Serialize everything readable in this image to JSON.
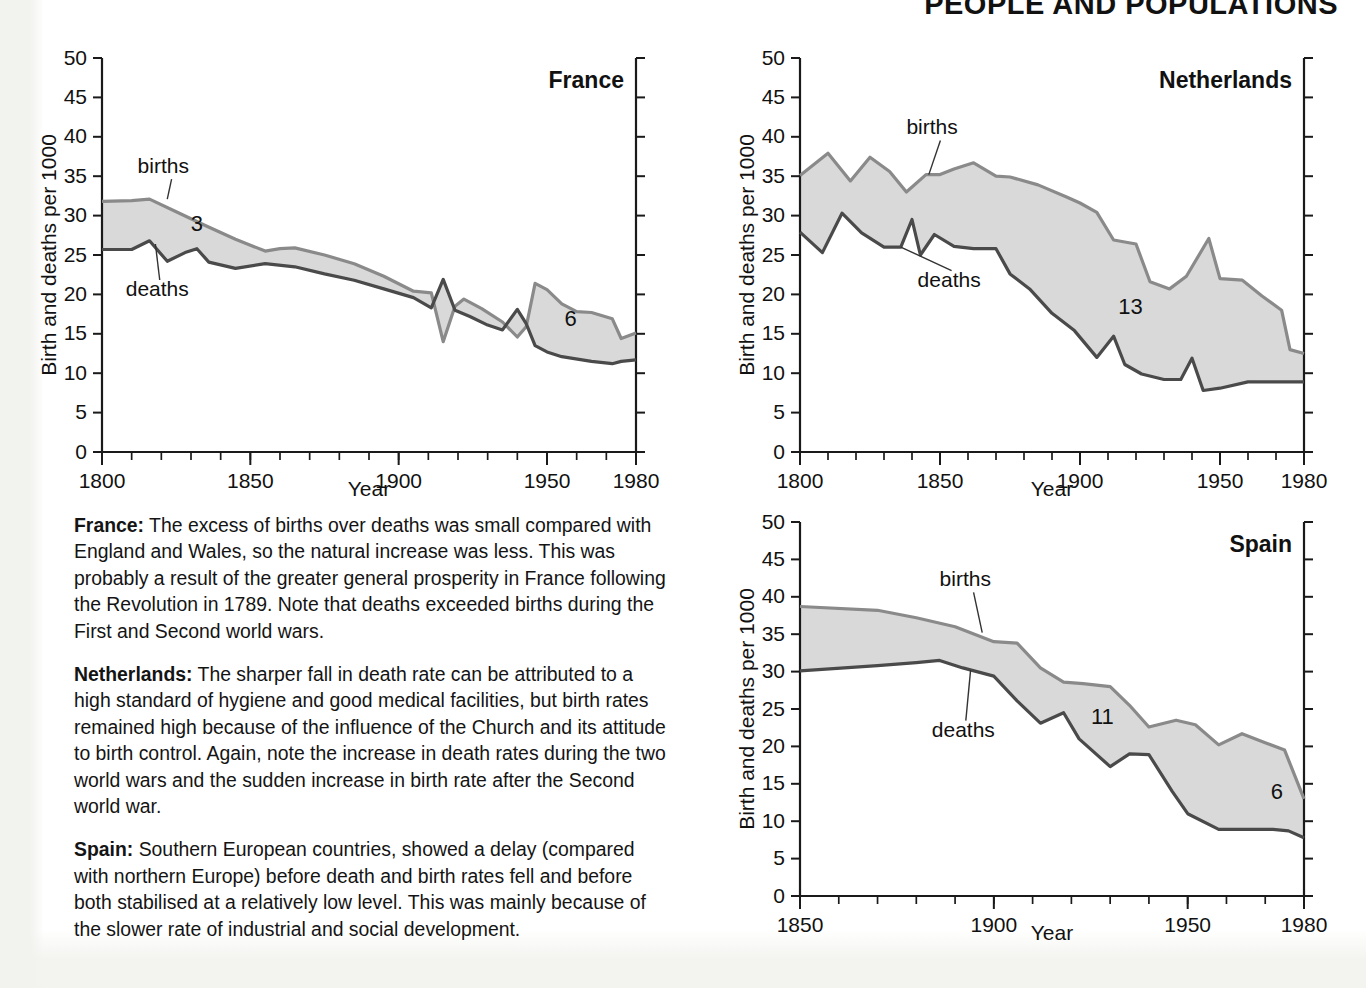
{
  "running_head": "PEOPLE AND POPULATIONS",
  "common": {
    "ylabel": "Birth and deaths per 1000",
    "xlabel": "Year",
    "births_label": "births",
    "deaths_label": "deaths",
    "band_color": "#d9d9d9",
    "births_color": "#8a8a8a",
    "deaths_color": "#4a4a4a"
  },
  "body_text": [
    {
      "lead": "France:",
      "text": " The excess of births over deaths was small compared with England and Wales, so the natural increase was less. This was probably a result of the greater general prosperity in France following the Revolution in 1789. Note that deaths exceeded births during the First and Second world wars."
    },
    {
      "lead": "Netherlands:",
      "text": " The sharper fall in death rate can be attributed to a high standard of hygiene and good medical facilities, but birth rates remained high because of the influence of the Church and its attitude to birth control. Again, note the increase in death rates during the two world wars and the sudden increase in birth rate after the Second world war."
    },
    {
      "lead": "Spain:",
      "text": " Southern European countries, showed a delay (compared with northern Europe) before death and birth rates fell and before both stabilised at a relatively low level. This was mainly because of the slower rate of industrial and social development."
    }
  ],
  "chart_data": [
    {
      "id": "france",
      "type": "area",
      "title": "France",
      "xlabel": "Year",
      "ylabel": "Birth and deaths per 1000",
      "xlim": [
        1800,
        1980
      ],
      "ylim": [
        0,
        50
      ],
      "ytick_step": 5,
      "xtick_major": [
        1800,
        1850,
        1900,
        1950,
        1980
      ],
      "xtick_minor_step": 10,
      "grid": false,
      "annotations": [
        {
          "text": "3",
          "x": 1832,
          "y": 28.0
        },
        {
          "text": "6",
          "x": 1958,
          "y": 16.0
        }
      ],
      "series": [
        {
          "name": "births",
          "x": [
            1800,
            1810,
            1816,
            1825,
            1835,
            1845,
            1855,
            1860,
            1865,
            1875,
            1885,
            1895,
            1905,
            1911,
            1915,
            1919,
            1922,
            1928,
            1935,
            1940,
            1943,
            1946,
            1950,
            1955,
            1960,
            1965,
            1972,
            1975,
            1980
          ],
          "values": [
            31.8,
            31.9,
            32.1,
            30.5,
            28.7,
            27.0,
            25.5,
            25.8,
            25.9,
            25.0,
            23.9,
            22.3,
            20.4,
            20.2,
            14.0,
            18.5,
            19.4,
            18.2,
            16.5,
            14.6,
            15.9,
            21.4,
            20.6,
            18.8,
            17.8,
            17.7,
            16.9,
            14.4,
            15.1
          ]
        },
        {
          "name": "deaths",
          "x": [
            1800,
            1810,
            1816,
            1822,
            1828,
            1832,
            1836,
            1845,
            1855,
            1865,
            1875,
            1885,
            1895,
            1905,
            1911,
            1915,
            1919,
            1924,
            1930,
            1935,
            1940,
            1943,
            1946,
            1950,
            1955,
            1965,
            1972,
            1975,
            1980
          ],
          "values": [
            25.7,
            25.7,
            26.8,
            24.2,
            25.3,
            25.8,
            24.1,
            23.3,
            23.9,
            23.5,
            22.6,
            21.8,
            20.7,
            19.6,
            18.3,
            21.9,
            18.0,
            17.2,
            16.1,
            15.5,
            18.1,
            16.3,
            13.5,
            12.7,
            12.1,
            11.5,
            11.2,
            11.5,
            11.7
          ]
        }
      ]
    },
    {
      "id": "netherlands",
      "type": "area",
      "title": "Netherlands",
      "xlabel": "Year",
      "ylabel": "Birth and deaths per 1000",
      "xlim": [
        1800,
        1980
      ],
      "ylim": [
        0,
        50
      ],
      "ytick_step": 5,
      "xtick_major": [
        1800,
        1850,
        1900,
        1950,
        1980
      ],
      "xtick_minor_step": 10,
      "grid": false,
      "annotations": [
        {
          "text": "13",
          "x": 1918,
          "y": 17.5
        }
      ],
      "series": [
        {
          "name": "births",
          "x": [
            1800,
            1810,
            1818,
            1825,
            1832,
            1838,
            1845,
            1850,
            1855,
            1862,
            1870,
            1875,
            1885,
            1895,
            1900,
            1906,
            1912,
            1920,
            1925,
            1932,
            1938,
            1946,
            1950,
            1958,
            1965,
            1972,
            1975,
            1980
          ],
          "values": [
            35.1,
            37.9,
            34.4,
            37.4,
            35.6,
            33.0,
            35.2,
            35.2,
            35.9,
            36.7,
            35.0,
            34.9,
            33.9,
            32.4,
            31.6,
            30.4,
            26.9,
            26.4,
            21.6,
            20.7,
            22.3,
            27.1,
            22.0,
            21.8,
            19.8,
            18.0,
            13.0,
            12.5
          ]
        },
        {
          "name": "deaths",
          "x": [
            1800,
            1808,
            1815,
            1822,
            1830,
            1836,
            1840,
            1843,
            1848,
            1855,
            1862,
            1870,
            1875,
            1882,
            1890,
            1898,
            1906,
            1912,
            1916,
            1922,
            1930,
            1936,
            1940,
            1944,
            1950,
            1960,
            1970,
            1980
          ],
          "values": [
            27.9,
            25.3,
            30.3,
            27.8,
            26.0,
            26.0,
            29.5,
            25.0,
            27.6,
            26.1,
            25.8,
            25.8,
            22.6,
            20.7,
            17.6,
            15.4,
            12.0,
            14.7,
            11.1,
            9.9,
            9.2,
            9.2,
            11.9,
            7.8,
            8.1,
            8.9,
            8.9,
            8.9
          ]
        }
      ]
    },
    {
      "id": "spain",
      "type": "area",
      "title": "Spain",
      "xlabel": "Year",
      "ylabel": "Birth and deaths per 1000",
      "xlim": [
        1850,
        1980
      ],
      "ylim": [
        0,
        50
      ],
      "ytick_step": 5,
      "xtick_major": [
        1850,
        1900,
        1950,
        1980
      ],
      "xtick_minor_step": 10,
      "grid": false,
      "annotations": [
        {
          "text": "11",
          "x": 1928,
          "y": 23.0
        },
        {
          "text": "6",
          "x": 1973,
          "y": 13.0
        }
      ],
      "series": [
        {
          "name": "births",
          "x": [
            1850,
            1870,
            1880,
            1890,
            1900,
            1906,
            1912,
            1918,
            1923,
            1930,
            1935,
            1940,
            1947,
            1952,
            1958,
            1964,
            1970,
            1975,
            1980
          ],
          "values": [
            38.7,
            38.2,
            37.2,
            36.0,
            34.0,
            33.8,
            30.5,
            28.6,
            28.4,
            28.0,
            25.5,
            22.6,
            23.5,
            22.9,
            20.2,
            21.7,
            20.5,
            19.5,
            13.0
          ]
        },
        {
          "name": "deaths",
          "x": [
            1850,
            1870,
            1880,
            1886,
            1892,
            1900,
            1906,
            1912,
            1918,
            1922,
            1930,
            1935,
            1940,
            1946,
            1950,
            1958,
            1964,
            1972,
            1976,
            1980
          ],
          "values": [
            30.1,
            30.8,
            31.2,
            31.5,
            30.5,
            29.4,
            26.1,
            23.1,
            24.5,
            21.0,
            17.3,
            19.0,
            18.9,
            14.0,
            11.0,
            8.9,
            8.9,
            8.9,
            8.7,
            7.8
          ]
        }
      ]
    }
  ]
}
